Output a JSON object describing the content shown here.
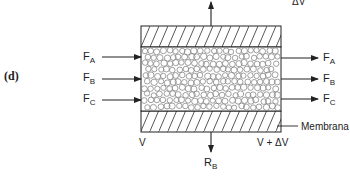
{
  "figure": {
    "panel_label": "(d)",
    "top_output": {
      "label": "ΔV"
    },
    "inlet_streams": [
      {
        "main": "F",
        "sub": "A"
      },
      {
        "main": "F",
        "sub": "B"
      },
      {
        "main": "F",
        "sub": "C"
      }
    ],
    "outlet_streams": [
      {
        "main": "F",
        "sub": "A"
      },
      {
        "main": "F",
        "sub": "B"
      },
      {
        "main": "F",
        "sub": "C"
      }
    ],
    "bottom_output": {
      "main": "R",
      "sub": "B"
    },
    "volume_in": "V",
    "volume_out": "V + ΔV",
    "membrane_label": "Membrana",
    "colors": {
      "line": "#222222",
      "hatch": "#444444",
      "particle": "#888888"
    }
  }
}
